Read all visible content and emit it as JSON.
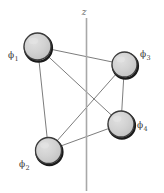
{
  "figure": {
    "width": 164,
    "height": 193,
    "background_color": "#ffffff"
  },
  "axis": {
    "name": "z-axis",
    "label": "z",
    "label_x": 84,
    "label_y": 15,
    "x": 86.5,
    "y_top": 18,
    "y_bottom": 191,
    "color": "#a8a8a8",
    "stroke_width": 1.6
  },
  "graph": {
    "node_style": {
      "fill": "#cfcfcf",
      "stroke": "#3b3b3b",
      "stroke_width": 1.3,
      "shadow_color": "#1a1a1a",
      "highlight_color": "#e6e6e6"
    },
    "edge_style": {
      "stroke": "#6d6d6d",
      "stroke_width": 0.9
    },
    "nodes": [
      {
        "id": "phi1",
        "label_base": "ϕ",
        "label_sub": "1",
        "cx": 37.5,
        "cy": 46.5,
        "r": 13.5,
        "label_x": 8,
        "label_y": 58,
        "label_anchor": "start"
      },
      {
        "id": "phi2",
        "label_base": "ϕ",
        "label_sub": "2",
        "cx": 48.5,
        "cy": 150.5,
        "r": 13.0,
        "label_x": 19,
        "label_y": 167,
        "label_anchor": "start"
      },
      {
        "id": "phi3",
        "label_base": "ϕ",
        "label_sub": "3",
        "cx": 124.5,
        "cy": 64.5,
        "r": 12.5,
        "label_x": 140,
        "label_y": 57,
        "label_anchor": "start"
      },
      {
        "id": "phi4",
        "label_base": "ϕ",
        "label_sub": "4",
        "cx": 121.0,
        "cy": 124.0,
        "r": 13.0,
        "label_x": 137,
        "label_y": 128,
        "label_anchor": "start"
      }
    ],
    "edges": [
      {
        "id": "edge-phi1-phi3",
        "from": "phi1",
        "to": "phi3"
      },
      {
        "id": "edge-phi1-phi2",
        "from": "phi1",
        "to": "phi2"
      },
      {
        "id": "edge-phi1-phi4",
        "from": "phi1",
        "to": "phi4"
      },
      {
        "id": "edge-phi2-phi3",
        "from": "phi2",
        "to": "phi3"
      },
      {
        "id": "edge-phi2-phi4",
        "from": "phi2",
        "to": "phi4"
      },
      {
        "id": "edge-phi3-phi4",
        "from": "phi3",
        "to": "phi4"
      }
    ]
  }
}
